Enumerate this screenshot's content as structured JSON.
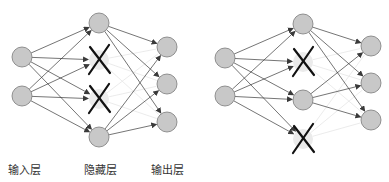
{
  "colors": {
    "node_fill": "#c8c8c8",
    "node_stroke": "#7a7a7a",
    "dropped_fill": "#ebebeb",
    "edge": "#3a3a3a",
    "faded_edge": "#e6e6e6",
    "cross": "#111111"
  },
  "labels": {
    "input_layer": "输入层",
    "hidden_layer": "隐藏层",
    "output_layer": "输出层"
  },
  "networks": [
    {
      "name": "left-network",
      "input": [
        {
          "x": 22,
          "y": 57
        },
        {
          "x": 22,
          "y": 96
        }
      ],
      "hidden": [
        {
          "x": 99,
          "y": 23,
          "dropped": false
        },
        {
          "x": 99,
          "y": 60,
          "dropped": true
        },
        {
          "x": 99,
          "y": 99,
          "dropped": true
        },
        {
          "x": 99,
          "y": 137,
          "dropped": false
        }
      ],
      "output": [
        {
          "x": 167,
          "y": 47
        },
        {
          "x": 167,
          "y": 84
        },
        {
          "x": 167,
          "y": 122
        }
      ]
    },
    {
      "name": "right-network",
      "input": [
        {
          "x": 225,
          "y": 58
        },
        {
          "x": 225,
          "y": 96
        }
      ],
      "hidden": [
        {
          "x": 303,
          "y": 24,
          "dropped": false
        },
        {
          "x": 303,
          "y": 62,
          "dropped": true
        },
        {
          "x": 303,
          "y": 100,
          "dropped": false
        },
        {
          "x": 303,
          "y": 139,
          "dropped": true
        }
      ],
      "output": [
        {
          "x": 371,
          "y": 46
        },
        {
          "x": 371,
          "y": 83
        },
        {
          "x": 371,
          "y": 120
        }
      ]
    }
  ],
  "node_radius": 10
}
